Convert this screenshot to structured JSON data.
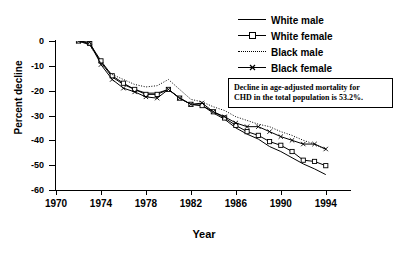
{
  "chart_data": {
    "type": "line",
    "title": "",
    "xlabel": "Year",
    "ylabel": "Percent decline",
    "xlim": [
      1970,
      1995
    ],
    "ylim": [
      -60,
      0
    ],
    "xticks": [
      1970,
      1974,
      1978,
      1982,
      1986,
      1990,
      1994
    ],
    "yticks": [
      0,
      -10,
      -20,
      -30,
      -40,
      -50,
      -60
    ],
    "grid": false,
    "legend_position": "top-right",
    "x": [
      1972,
      1973,
      1974,
      1975,
      1976,
      1977,
      1978,
      1979,
      1980,
      1981,
      1982,
      1983,
      1984,
      1985,
      1986,
      1987,
      1988,
      1989,
      1990,
      1991,
      1992,
      1993,
      1994
    ],
    "series": [
      {
        "name": "White male",
        "marker": "none",
        "linestyle": "solid",
        "values": [
          0,
          -1.5,
          -8.5,
          -14.5,
          -17.5,
          -19.5,
          -21.0,
          -21.0,
          -19.5,
          -23.0,
          -25.5,
          -26.0,
          -29.0,
          -31.5,
          -35.0,
          -37.5,
          -39.5,
          -42.5,
          -44.5,
          -47.0,
          -49.5,
          -51.5,
          -53.8
        ]
      },
      {
        "name": "White female",
        "marker": "open-square",
        "linestyle": "solid",
        "values": [
          0,
          -1.0,
          -8.0,
          -14.0,
          -17.0,
          -19.5,
          -21.5,
          -21.5,
          -19.5,
          -23.0,
          -25.5,
          -26.0,
          -28.5,
          -31.0,
          -34.0,
          -36.5,
          -38.0,
          -40.5,
          -42.0,
          -44.5,
          -48.0,
          -48.5,
          -50.2
        ]
      },
      {
        "name": "Black male",
        "marker": "none",
        "linestyle": "dotted",
        "values": [
          0,
          -1.5,
          -9.0,
          -13.5,
          -15.5,
          -17.5,
          -18.5,
          -18.0,
          -15.5,
          -19.5,
          -23.5,
          -24.5,
          -26.5,
          -28.0,
          -30.5,
          -32.0,
          -33.5,
          -34.5,
          -36.5,
          -38.0,
          -40.0,
          -41.5,
          -43.8
        ]
      },
      {
        "name": "Black female",
        "marker": "x",
        "linestyle": "solid",
        "values": [
          0,
          -0.5,
          -9.5,
          -15.5,
          -19.0,
          -20.5,
          -22.5,
          -23.0,
          -19.5,
          -23.0,
          -25.5,
          -25.0,
          -28.5,
          -30.5,
          -33.0,
          -34.5,
          -34.5,
          -36.5,
          -38.5,
          -40.0,
          -41.5,
          -41.5,
          -43.5
        ]
      }
    ],
    "annotations": [
      {
        "name": "total-population-note",
        "line1": "Decline in age-adjusted mortality for",
        "line2": "CHD in the total population is 53.2%."
      }
    ]
  }
}
